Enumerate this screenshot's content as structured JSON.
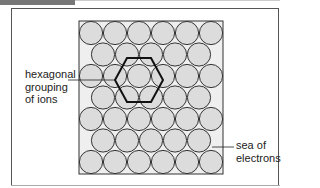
{
  "labels": {
    "hexagonal": [
      "hexagonal",
      "grouping",
      "of ions"
    ],
    "sea": [
      "sea of",
      "electrons"
    ]
  },
  "lattice": {
    "rows": 7,
    "row_counts": [
      6,
      5,
      6,
      5,
      6,
      5,
      6
    ],
    "ion_fill": "#dcdcdc",
    "ion_stroke": "#333333",
    "background_fill": "#efefef"
  }
}
